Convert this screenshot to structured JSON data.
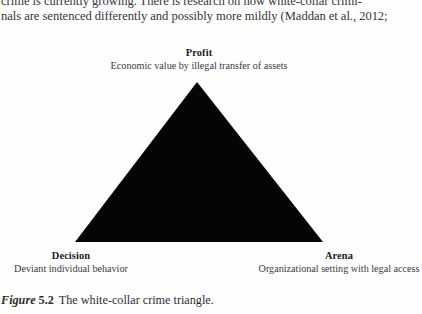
{
  "page": {
    "background_color": "#fefefe",
    "text_color": "#2b2b2b"
  },
  "body_text": {
    "line1": "crime is currently growing. There is research on how white-collar crimi-",
    "line2": "nals are sentenced differently and possibly more mildly (Maddan et al., 2012;"
  },
  "figure": {
    "shape": {
      "type": "triangle",
      "fill_color": "#050505",
      "apex": {
        "x": 197,
        "y": 42
      },
      "bottom_left": {
        "x": 75,
        "y": 202
      },
      "bottom_right": {
        "x": 323,
        "y": 202
      }
    },
    "vertices": [
      {
        "id": "profit",
        "title": "Profit",
        "subtitle": "Economic value by illegal transfer of assets",
        "position": "apex-top"
      },
      {
        "id": "decision",
        "title": "Decision",
        "subtitle": "Deviant individual behavior",
        "position": "bottom-left"
      },
      {
        "id": "arena",
        "title": "Arena",
        "subtitle": "Organizational setting with legal access",
        "position": "bottom-right"
      }
    ]
  },
  "caption": {
    "figure_word": "Figure",
    "figure_number": "5.2",
    "text": "The white-collar crime triangle."
  }
}
